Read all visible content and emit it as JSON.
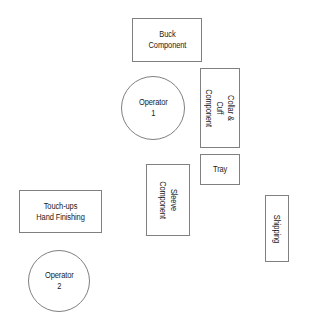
{
  "diagram": {
    "type": "facility-layout",
    "background_color": "#ffffff",
    "stroke_color": "#808080",
    "text_color": "#1a1a1a",
    "nodes": [
      {
        "id": "buck-component",
        "label": "Buck\nComponent",
        "shape": "rectangle",
        "orientation": "horizontal",
        "x": 132,
        "y": 18,
        "w": 70,
        "h": 44
      },
      {
        "id": "operator-1",
        "label": "Operator\n1",
        "shape": "circle",
        "orientation": "horizontal",
        "x": 121,
        "y": 76,
        "w": 64,
        "h": 64
      },
      {
        "id": "collar-cuff-component",
        "label": "Collar & Cuff\nComponent",
        "shape": "rectangle",
        "orientation": "vertical",
        "x": 200,
        "y": 68,
        "w": 40,
        "h": 80
      },
      {
        "id": "tray",
        "label": "Tray",
        "shape": "rectangle",
        "orientation": "horizontal",
        "x": 200,
        "y": 154,
        "w": 40,
        "h": 31
      },
      {
        "id": "sleeve-component",
        "label": "Sleeve\nComponent",
        "shape": "rectangle",
        "orientation": "vertical",
        "x": 146,
        "y": 164,
        "w": 44,
        "h": 72
      },
      {
        "id": "touch-ups-hand-finishing",
        "label": "Touch-ups\nHand Finishing",
        "shape": "rectangle",
        "orientation": "horizontal",
        "x": 19,
        "y": 190,
        "w": 83,
        "h": 43
      },
      {
        "id": "operator-2",
        "label": "Operator\n2",
        "shape": "circle",
        "orientation": "horizontal",
        "x": 28,
        "y": 250,
        "w": 62,
        "h": 62
      },
      {
        "id": "shipping",
        "label": "Shipping",
        "shape": "rectangle",
        "orientation": "vertical",
        "x": 265,
        "y": 195,
        "w": 24,
        "h": 67
      }
    ]
  }
}
